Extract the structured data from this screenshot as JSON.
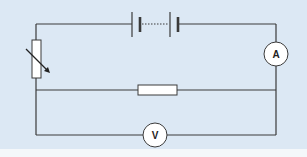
{
  "diagram": {
    "type": "circuit",
    "background_color": "#dce8f4",
    "wire_color": "#3a3a3a",
    "components": [
      {
        "id": "battery",
        "kind": "battery",
        "cells": "multiple (dotted)"
      },
      {
        "id": "variable-resistor",
        "kind": "variable resistor"
      },
      {
        "id": "ammeter",
        "kind": "ammeter",
        "label": "A"
      },
      {
        "id": "resistor",
        "kind": "fixed resistor"
      },
      {
        "id": "voltmeter",
        "kind": "voltmeter",
        "label": "V"
      }
    ],
    "ammeter_label": "A",
    "voltmeter_label": "V"
  }
}
